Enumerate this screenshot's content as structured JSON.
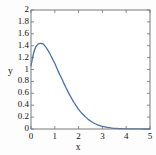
{
  "figure": {
    "background_color": "#fdfdfd",
    "frame_color": "#7a7a7a",
    "text_color": "#141414"
  },
  "chart_data": {
    "type": "line",
    "title": "",
    "xlabel": "x",
    "ylabel": "y",
    "xlim": [
      0,
      5
    ],
    "ylim": [
      0,
      2
    ],
    "grid": false,
    "legend": null,
    "xticks": [
      0,
      1,
      2,
      3,
      4,
      5
    ],
    "xtick_labels": [
      "0",
      "1",
      "2",
      "3",
      "4",
      "5"
    ],
    "yticks": [
      0,
      0.2,
      0.4,
      0.6,
      0.8,
      1,
      1.2,
      1.4,
      1.6,
      1.8,
      2
    ],
    "ytick_labels": [
      "0",
      "0.2",
      "0.4",
      "0.6",
      "0.8",
      "1",
      "1.2",
      "1.4",
      "1.6",
      "1.8",
      "2"
    ],
    "series": [
      {
        "name": "curve",
        "color": "#4a72ad",
        "line_width": 1.3,
        "peak_x": 0.42,
        "peak_y": 1.44,
        "x": [
          0.0,
          0.1,
          0.2,
          0.3,
          0.4,
          0.5,
          0.6,
          0.7,
          0.8,
          0.9,
          1.0,
          1.1,
          1.2,
          1.3,
          1.4,
          1.5,
          1.6,
          1.7,
          1.8,
          1.9,
          2.0,
          2.1,
          2.2,
          2.3,
          2.4,
          2.5,
          2.6,
          2.7,
          2.8,
          2.9,
          3.0,
          3.2,
          3.4,
          3.6,
          3.8,
          4.0,
          4.25,
          4.5,
          4.75,
          5.0
        ],
        "y": [
          1.06,
          1.26,
          1.38,
          1.43,
          1.44,
          1.43,
          1.39,
          1.33,
          1.26,
          1.18,
          1.1,
          1.01,
          0.92,
          0.84,
          0.75,
          0.67,
          0.59,
          0.52,
          0.45,
          0.39,
          0.33,
          0.28,
          0.24,
          0.2,
          0.165,
          0.135,
          0.11,
          0.088,
          0.07,
          0.055,
          0.043,
          0.026,
          0.015,
          0.009,
          0.005,
          0.003,
          0.0015,
          0.0008,
          0.0004,
          0.0002
        ]
      }
    ]
  }
}
